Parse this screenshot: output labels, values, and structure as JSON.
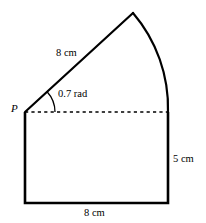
{
  "figure": {
    "type": "geometry-diagram",
    "canvas": {
      "width": 206,
      "height": 223
    },
    "stroke_color": "#000000",
    "background_color": "#ffffff",
    "vertex_label": "P",
    "labels": {
      "radius_length": "8 cm",
      "angle": "0.7 rad",
      "right_side_length": "5 cm",
      "base_length": "8 cm"
    },
    "measurements": [
      {
        "name": "sector-radius",
        "value": 8,
        "unit": "cm",
        "text": "8 cm"
      },
      {
        "name": "sector-angle",
        "value": 0.7,
        "unit": "rad",
        "text": "0.7 rad"
      },
      {
        "name": "rectangle-height",
        "value": 5,
        "unit": "cm",
        "text": "5 cm"
      },
      {
        "name": "rectangle-width",
        "value": 8,
        "unit": "cm",
        "text": "8 cm"
      }
    ],
    "geometry": {
      "P": {
        "x": 25,
        "y": 112
      },
      "apex": {
        "x": 133,
        "y": 13
      },
      "arc_end": {
        "x": 168,
        "y": 112
      },
      "rect_bottom_left": {
        "x": 25,
        "y": 203
      },
      "rect_bottom_right": {
        "x": 168,
        "y": 203
      },
      "angle_arc_radius": 30,
      "sector_radius_px": 146
    }
  }
}
